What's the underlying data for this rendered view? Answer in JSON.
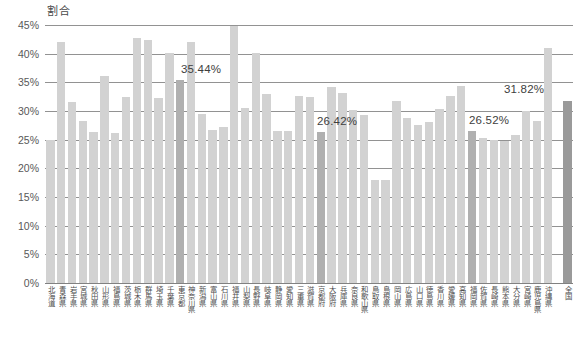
{
  "axis": {
    "y_title": "割合",
    "y_ticks": [
      "45%",
      "40%",
      "35%",
      "30%",
      "25%",
      "20%",
      "15%",
      "10%",
      "5%",
      "0%"
    ],
    "y_min": 0,
    "y_max": 45
  },
  "colors": {
    "bar": "#d2d2d2",
    "bar_highlight": "#b0b0b0",
    "bar_total": "#9a9a9a",
    "gridline": "#7f7f7f",
    "text": "#4f4f4f"
  },
  "labels": {
    "tokyo": "35.44%",
    "kyoto": "26.42%",
    "fukuoka": "26.52%",
    "zenkoku": "31.82%"
  },
  "chart_data": {
    "type": "bar",
    "title": "",
    "xlabel": "",
    "ylabel": "割合",
    "ylim": [
      0,
      45
    ],
    "ytick_step": 5,
    "grid": true,
    "legend": "none",
    "categories": [
      "北海道",
      "青森県",
      "岩手県",
      "宮城県",
      "秋田県",
      "山形県",
      "福島県",
      "茨城県",
      "栃木県",
      "群馬県",
      "埼玉県",
      "千葉県",
      "東京都",
      "神奈川県",
      "新潟県",
      "富山県",
      "石川県",
      "福井県",
      "山梨県",
      "長野県",
      "岐阜県",
      "静岡県",
      "愛知県",
      "三重県",
      "滋賀県",
      "京都府",
      "大阪府",
      "兵庫県",
      "奈良県",
      "和歌山県",
      "鳥取県",
      "島根県",
      "岡山県",
      "広島県",
      "山口県",
      "徳島県",
      "香川県",
      "愛媛県",
      "高知県",
      "福岡県",
      "佐賀県",
      "長崎県",
      "熊本県",
      "大分県",
      "宮崎県",
      "鹿児島県",
      "沖縄県",
      "全国"
    ],
    "values": [
      24.9,
      42.1,
      31.5,
      28.3,
      26.4,
      36.1,
      26.2,
      32.4,
      42.8,
      42.3,
      32.3,
      40.2,
      35.44,
      42.1,
      29.5,
      26.7,
      27.2,
      44.9,
      30.5,
      40.1,
      33.0,
      26.6,
      26.5,
      32.7,
      32.4,
      26.42,
      34.2,
      33.2,
      30.1,
      29.3,
      17.9,
      17.9,
      31.8,
      28.7,
      27.5,
      28.0,
      30.3,
      32.7,
      34.4,
      26.52,
      25.3,
      24.9,
      24.7,
      25.9,
      30.0,
      28.2,
      41.0,
      31.82
    ],
    "highlighted": [
      "東京都",
      "京都府",
      "福岡県"
    ],
    "total_bar": "全国",
    "value_labels": {
      "東京都": "35.44%",
      "京都府": "26.42%",
      "福岡県": "26.52%",
      "全国": "31.82%"
    }
  }
}
